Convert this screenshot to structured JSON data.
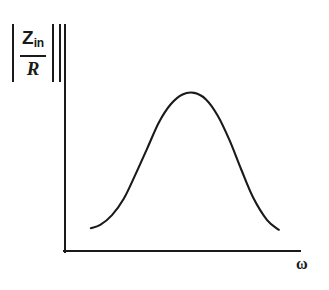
{
  "chart_data": {
    "type": "line",
    "title": "",
    "ylabel": "|Z_in / R|",
    "ylabel_parts": {
      "numerator_symbol": "Z",
      "numerator_subscript": "in",
      "denominator": "R",
      "abs_bar": "|"
    },
    "xlabel": "ω",
    "grid": false,
    "legend": null,
    "axis_ranges": {
      "x": [
        0,
        1
      ],
      "y": [
        0,
        1
      ]
    },
    "axis_ticks": {
      "x": [],
      "y": []
    },
    "series": [
      {
        "name": "|Zin/R| resonance response",
        "x": [
          0.11,
          0.15,
          0.2,
          0.25,
          0.3,
          0.35,
          0.4,
          0.45,
          0.5,
          0.55,
          0.6,
          0.65,
          0.7,
          0.75,
          0.8,
          0.86,
          0.91
        ],
        "y": [
          0.14,
          0.16,
          0.22,
          0.32,
          0.47,
          0.63,
          0.79,
          0.9,
          0.96,
          0.97,
          0.93,
          0.83,
          0.68,
          0.5,
          0.33,
          0.19,
          0.13
        ]
      }
    ],
    "annotations": []
  },
  "figure": {
    "axis_color": "#1a1a1a",
    "curve_color": "#1a1a1a",
    "background_color": "#ffffff"
  }
}
